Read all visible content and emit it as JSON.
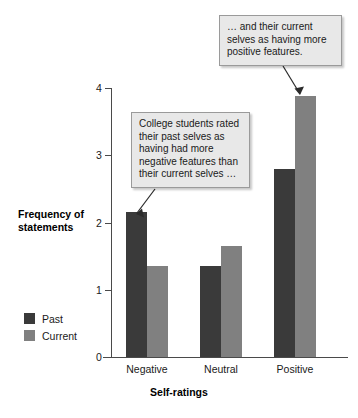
{
  "chart_data": {
    "type": "bar",
    "title": "",
    "xlabel": "Self-ratings",
    "ylabel": "Frequency of statements",
    "categories": [
      "Negative",
      "Neutral",
      "Positive"
    ],
    "series": [
      {
        "name": "Past",
        "color": "#3a3a3a",
        "values": [
          2.15,
          1.35,
          2.8
        ]
      },
      {
        "name": "Current",
        "color": "#808080",
        "values": [
          1.35,
          1.65,
          3.88
        ]
      }
    ],
    "ylim": [
      0,
      4
    ],
    "yticks": [
      0,
      1,
      2,
      3,
      4
    ],
    "ytick_labels": [
      "0",
      "1",
      "2",
      "3",
      "4"
    ],
    "grid": false,
    "legend_position": "lower-left-outside",
    "annotations": [
      {
        "id": "top",
        "text": "… and their current selves as having more positive features.",
        "points_to": "Positive / Current bar"
      },
      {
        "id": "bottom",
        "text": "College students rated their past selves as having had more negative features than their current selves …",
        "points_to": "Negative / Past bar"
      }
    ]
  },
  "axes": {
    "y_title": "Frequency of statements",
    "x_title": "Self-ratings"
  },
  "legend": {
    "items": [
      {
        "label": "Past",
        "color": "#3a3a3a"
      },
      {
        "label": "Current",
        "color": "#808080"
      }
    ]
  }
}
